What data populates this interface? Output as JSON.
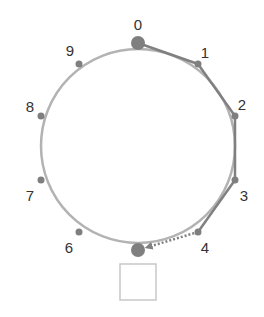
{
  "diagram": {
    "type": "ring",
    "colors": {
      "ring": "#b3b3b3",
      "node": "#7f7f7f",
      "path": "#808080",
      "box_stroke": "#c8c8c8",
      "label": "#333333"
    },
    "ring": {
      "cx": 138,
      "cy": 146,
      "r": 97
    },
    "nodes": [
      {
        "id": "0",
        "label": "0",
        "x": 138,
        "y": 43,
        "r": 7,
        "lx": 138,
        "ly": 26,
        "large": true
      },
      {
        "id": "1",
        "label": "1",
        "x": 198,
        "y": 64,
        "r": 3.5,
        "lx": 205,
        "ly": 54
      },
      {
        "id": "2",
        "label": "2",
        "x": 235,
        "y": 116,
        "r": 3.5,
        "lx": 242,
        "ly": 106
      },
      {
        "id": "3",
        "label": "3",
        "x": 235,
        "y": 180,
        "r": 3.5,
        "lx": 244,
        "ly": 197
      },
      {
        "id": "4",
        "label": "4",
        "x": 198,
        "y": 232,
        "r": 3.5,
        "lx": 205,
        "ly": 249
      },
      {
        "id": "5",
        "label": "",
        "x": 138,
        "y": 250,
        "r": 7,
        "large": true
      },
      {
        "id": "6",
        "label": "6",
        "x": 79,
        "y": 232,
        "r": 3.5,
        "lx": 69,
        "ly": 249
      },
      {
        "id": "7",
        "label": "7",
        "x": 41,
        "y": 180,
        "r": 3.5,
        "lx": 30,
        "ly": 197
      },
      {
        "id": "8",
        "label": "8",
        "x": 41,
        "y": 116,
        "r": 3.5,
        "lx": 30,
        "ly": 108
      },
      {
        "id": "9",
        "label": "9",
        "x": 79,
        "y": 64,
        "r": 3.5,
        "lx": 70,
        "ly": 52
      }
    ],
    "edges": [
      {
        "from": "0",
        "to": "1",
        "style": "solid"
      },
      {
        "from": "1",
        "to": "2",
        "style": "solid"
      },
      {
        "from": "2",
        "to": "3",
        "style": "solid"
      },
      {
        "from": "3",
        "to": "4",
        "style": "solid"
      },
      {
        "from": "4",
        "to": "5",
        "style": "dotted-arrow"
      }
    ],
    "box": {
      "x": 120,
      "y": 264,
      "w": 36,
      "h": 36
    }
  }
}
